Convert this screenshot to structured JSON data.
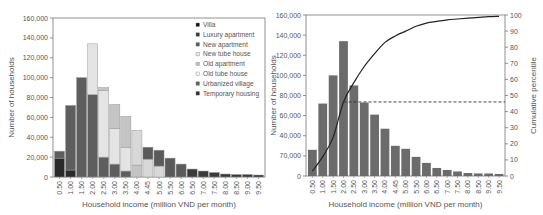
{
  "chart_data": [
    {
      "type": "bar",
      "stacked": true,
      "title": "",
      "xlabel": "Household income (million VND per month)",
      "ylabel": "Number of households",
      "ylim": [
        0,
        160000
      ],
      "yticks": [
        "0",
        "20,000",
        "40,000",
        "60,000",
        "80,000",
        "100,000",
        "120,000",
        "140,000",
        "160,000"
      ],
      "grid": false,
      "legend_position": "upper right",
      "categories": [
        "0.50",
        "1.00",
        "1.50",
        "2.00",
        "2.50",
        "3.00",
        "3.50",
        "4.00",
        "4.45",
        "5.00",
        "5.50",
        "6.00",
        "6.50",
        "7.00",
        "7.50",
        "8.00",
        "8.50",
        "9.00",
        "9.50"
      ],
      "series": [
        {
          "name": "Temporary housing",
          "color": "#2a2a2a",
          "values": [
            19000,
            7000,
            0,
            0,
            0,
            0,
            0,
            0,
            0,
            0,
            0,
            0,
            0,
            0,
            0,
            0,
            0,
            0,
            0
          ]
        },
        {
          "name": "Urbanized village",
          "color": "#5e5e5e",
          "values": [
            7000,
            65000,
            100000,
            83000,
            20000,
            13000,
            6000,
            0,
            0,
            0,
            0,
            0,
            0,
            0,
            0,
            0,
            0,
            0,
            0
          ]
        },
        {
          "name": "Old tube house",
          "color": "#e4e4e4",
          "values": [
            0,
            0,
            0,
            51000,
            67000,
            36000,
            24000,
            0,
            0,
            0,
            0,
            0,
            0,
            0,
            0,
            0,
            0,
            0,
            0
          ]
        },
        {
          "name": "Old apartment",
          "color": "#c4c4c4",
          "values": [
            0,
            0,
            0,
            0,
            3000,
            24000,
            31000,
            12000,
            0,
            0,
            0,
            0,
            0,
            0,
            0,
            0,
            0,
            0,
            0
          ]
        },
        {
          "name": "New tube house",
          "color": "#d8d8d8",
          "values": [
            0,
            0,
            0,
            0,
            0,
            0,
            0,
            35000,
            18000,
            11000,
            0,
            0,
            0,
            0,
            0,
            0,
            0,
            0,
            0
          ]
        },
        {
          "name": "New apartment",
          "color": "#5a5a5a",
          "values": [
            0,
            0,
            0,
            0,
            0,
            0,
            0,
            0,
            12000,
            16000,
            19000,
            13000,
            0,
            0,
            0,
            0,
            0,
            0,
            0
          ]
        },
        {
          "name": "Luxury apartment",
          "color": "#3a3a3a",
          "values": [
            0,
            0,
            0,
            0,
            0,
            0,
            0,
            0,
            0,
            0,
            0,
            0,
            8000,
            6000,
            4500,
            3000,
            2500,
            2500,
            2000
          ]
        },
        {
          "name": "Villa",
          "color": "#111111",
          "values": [
            0,
            0,
            0,
            0,
            0,
            0,
            0,
            0,
            0,
            0,
            0,
            0,
            0,
            0,
            0,
            0,
            0,
            0,
            0
          ]
        }
      ],
      "legend": [
        "Villa",
        "Luxury apartment",
        "New apartment",
        "New tube house",
        "Old apartment",
        "Old tube house",
        "Urbanized village",
        "Temporary housing"
      ]
    },
    {
      "type": "bar",
      "title": "",
      "xlabel": "Household income (million VND per month)",
      "ylabel": "Number of households",
      "y2label": "Cumulative percentile",
      "ylim": [
        0,
        160000
      ],
      "y2lim": [
        0,
        100
      ],
      "yticks": [
        "0",
        "70,000",
        "40,000",
        "60,000",
        "80,000",
        "100,000",
        "120,000",
        "140,000",
        "160,000"
      ],
      "y2ticks": [
        "0",
        "10",
        "20",
        "30",
        "40",
        "50",
        "60",
        "70",
        "80",
        "90",
        "100"
      ],
      "grid": false,
      "categories": [
        "0.50",
        "1.00",
        "1.50",
        "2.00",
        "2.50",
        "3.00",
        "3.50",
        "4.00",
        "4.45",
        "5.00",
        "5.50",
        "6.00",
        "6.50",
        "7.00",
        "7.50",
        "8.00",
        "8.50",
        "9.00",
        "9.50"
      ],
      "series": [
        {
          "name": "Number of households",
          "type": "bar",
          "color": "#6b6b6b",
          "values": [
            26000,
            72000,
            100000,
            134000,
            90000,
            73000,
            61000,
            47000,
            30000,
            27000,
            19000,
            13000,
            8000,
            6000,
            4500,
            3000,
            2500,
            2500,
            2000
          ]
        },
        {
          "name": "Cumulative percentile",
          "type": "line",
          "axis": "y2",
          "color": "#222222",
          "values": [
            3,
            12,
            24,
            46,
            58,
            68,
            76,
            83,
            87,
            90,
            93,
            95,
            96,
            97,
            97.5,
            98,
            98.5,
            99,
            99.2
          ]
        }
      ],
      "annotations": [
        {
          "type": "dashed-hline",
          "y2": 46,
          "from_category": "2.00",
          "to": "right-axis"
        }
      ]
    }
  ]
}
